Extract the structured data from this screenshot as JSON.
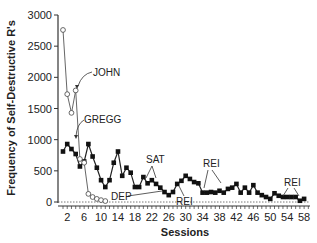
{
  "chart_data": {
    "type": "line",
    "title": "",
    "xlabel": "Sessions",
    "ylabel": "Frequency of Self-Destructive R's",
    "ylim": [
      0,
      3000
    ],
    "xlim": [
      1,
      59
    ],
    "yticks": [
      0,
      500,
      1000,
      1500,
      2000,
      2500,
      3000
    ],
    "xticks": [
      2,
      6,
      10,
      14,
      18,
      22,
      26,
      30,
      34,
      38,
      42,
      46,
      50,
      54,
      58
    ],
    "grid": false,
    "legend": "none (direct labels)",
    "series": [
      {
        "name": "JOHN",
        "marker": "open-circle",
        "x": [
          1,
          2,
          3,
          4,
          5,
          6,
          7,
          8,
          9,
          10,
          11
        ],
        "values": [
          2760,
          1730,
          1430,
          1790,
          690,
          630,
          130,
          80,
          50,
          30,
          15
        ]
      },
      {
        "name": "GREGG",
        "marker": "filled-square",
        "x": [
          1,
          2,
          3,
          4,
          5,
          6,
          7,
          8,
          9,
          10,
          11,
          12,
          13,
          14,
          15,
          16,
          17,
          18,
          19,
          20,
          21,
          22,
          23,
          24,
          25,
          26,
          27,
          28,
          29,
          30,
          31,
          32,
          33,
          34,
          35,
          36,
          37,
          38,
          39,
          40,
          41,
          42,
          43,
          44,
          45,
          46,
          47,
          48,
          49,
          50,
          51,
          52,
          53,
          54,
          55,
          56,
          57,
          58
        ],
        "values": [
          810,
          930,
          850,
          770,
          570,
          650,
          930,
          730,
          550,
          350,
          240,
          350,
          630,
          810,
          420,
          550,
          470,
          240,
          240,
          400,
          300,
          350,
          290,
          230,
          160,
          110,
          160,
          290,
          340,
          420,
          370,
          320,
          300,
          150,
          150,
          160,
          150,
          180,
          150,
          210,
          230,
          290,
          150,
          230,
          150,
          270,
          150,
          110,
          80,
          50,
          140,
          100,
          80,
          80,
          80,
          80,
          20,
          50
        ]
      }
    ],
    "annotations": [
      {
        "text": "JOHN",
        "points_to_session": 4
      },
      {
        "text": "GREGG",
        "points_to_session": 7
      },
      {
        "text": "SAT",
        "points_to_sessions": [
          21,
          23
        ]
      },
      {
        "text": "DEP",
        "points_to_session": 24
      },
      {
        "text": "REI",
        "points_to_session": 28
      },
      {
        "text": "REI",
        "points_to_sessions": [
          36,
          40
        ]
      },
      {
        "text": "REI",
        "points_to_session": 55
      }
    ]
  }
}
